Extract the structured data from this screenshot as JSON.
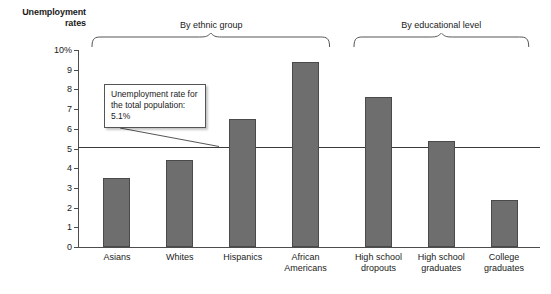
{
  "chart_data": {
    "type": "bar",
    "title": "",
    "ylabel": "Unemployment rates",
    "xlabel": "",
    "ylim": [
      0,
      10
    ],
    "ytick_labels": [
      "0",
      "1",
      "2",
      "3",
      "4",
      "5",
      "6",
      "7",
      "8",
      "9",
      "10%"
    ],
    "ytick_values": [
      0,
      1,
      2,
      3,
      4,
      5,
      6,
      7,
      8,
      9,
      10
    ],
    "grid": false,
    "legend": "none",
    "categories": [
      "Asians",
      "Whites",
      "Hispanics",
      "African Americans",
      "High school dropouts",
      "High school graduates",
      "College graduates"
    ],
    "values": [
      3.5,
      4.4,
      6.5,
      9.4,
      7.6,
      5.4,
      2.4
    ],
    "reference_line": {
      "value": 5.1,
      "label": "Unemployment rate for the total population: 5.1%"
    },
    "groups": [
      {
        "label": "By ethnic group",
        "categories": [
          "Asians",
          "Whites",
          "Hispanics",
          "African Americans"
        ]
      },
      {
        "label": "By educational level",
        "categories": [
          "High school dropouts",
          "High school graduates",
          "College graduates"
        ]
      }
    ],
    "bar_color": "#6e6e6e",
    "axis_color": "#4d4d4d"
  },
  "axis": {
    "y_title_line1": "Unemployment",
    "y_title_line2": "rates"
  },
  "categories_display": [
    {
      "line1": "Asians",
      "line2": ""
    },
    {
      "line1": "Whites",
      "line2": ""
    },
    {
      "line1": "Hispanics",
      "line2": ""
    },
    {
      "line1": "African",
      "line2": "Americans"
    },
    {
      "line1": "High school",
      "line2": "dropouts"
    },
    {
      "line1": "High school",
      "line2": "graduates"
    },
    {
      "line1": "College",
      "line2": "graduates"
    }
  ],
  "callout": {
    "line1": "Unemployment",
    "line2": "rate for the total",
    "line3": "population: 5.1%"
  },
  "groups_display": [
    {
      "label": "By ethnic group"
    },
    {
      "label": "By educational level"
    }
  ]
}
